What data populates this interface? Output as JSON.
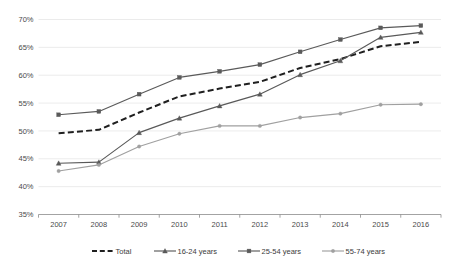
{
  "chart_data": {
    "type": "line",
    "title": "",
    "subtitle": "",
    "xlabel": "",
    "ylabel": "",
    "categories": [
      "2007",
      "2008",
      "2009",
      "2010",
      "2011",
      "2012",
      "2013",
      "2014",
      "2015",
      "2016"
    ],
    "x": [
      2007,
      2008,
      2009,
      2010,
      2011,
      2012,
      2013,
      2014,
      2015,
      2016
    ],
    "ylim": [
      35,
      70
    ],
    "ytick_labels": [
      "70%",
      "65%",
      "60%",
      "55%",
      "50%",
      "45%",
      "40%",
      "35%"
    ],
    "ytick_values": [
      70,
      65,
      60,
      55,
      50,
      45,
      40,
      35
    ],
    "grid": true,
    "legend_position": "bottom",
    "series": [
      {
        "name": "Total",
        "style": "dashed",
        "color": "#1f1f1f",
        "marker": "none",
        "values": [
          49.6,
          50.2,
          53.3,
          56.2,
          57.6,
          58.8,
          61.3,
          62.9,
          65.2,
          66.0
        ]
      },
      {
        "name": "16-24 years",
        "style": "solid",
        "color": "#595959",
        "marker": "triangle",
        "values": [
          44.2,
          44.4,
          49.7,
          52.3,
          54.5,
          56.6,
          60.1,
          62.6,
          66.8,
          67.7
        ]
      },
      {
        "name": "25-54 years",
        "style": "solid",
        "color": "#5a5a5a",
        "marker": "square",
        "values": [
          52.9,
          53.5,
          56.6,
          59.6,
          60.7,
          61.9,
          64.2,
          66.4,
          68.5,
          68.9
        ]
      },
      {
        "name": "55-74 years",
        "style": "solid",
        "color": "#a0a0a0",
        "marker": "dot",
        "values": [
          42.8,
          43.9,
          47.2,
          49.5,
          50.9,
          50.9,
          52.4,
          53.1,
          54.7,
          54.8
        ]
      }
    ]
  },
  "legend": {
    "items": [
      {
        "label": "Total"
      },
      {
        "label": "16-24 years"
      },
      {
        "label": "25-54 years"
      },
      {
        "label": "55-74 years"
      }
    ]
  },
  "colors": {
    "grid": "#e3e3e3",
    "axis": "#8c8c8c",
    "background": "#ffffff",
    "text": "#4a4a4a"
  }
}
